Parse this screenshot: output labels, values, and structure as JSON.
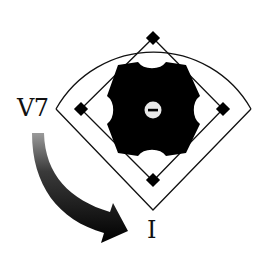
{
  "diagram": {
    "labels": {
      "from_chord": "V7",
      "to_chord": "I"
    },
    "mound_symbol": "−",
    "arrow": {
      "from": "V7",
      "to": "I",
      "direction": "curved down-right"
    },
    "elements": {
      "outfield_fence": "arc",
      "foul_lines": "diagonal",
      "base_paths": "diamond",
      "bases": [
        "second-base",
        "third-base",
        "first-base",
        "home-plate"
      ],
      "infield": "black scalloped octagon",
      "pitchers_mound": "circle with minus sign"
    },
    "colors": {
      "ink": "#111111",
      "background": "#ffffff",
      "mound": "#e8e8e8"
    }
  }
}
